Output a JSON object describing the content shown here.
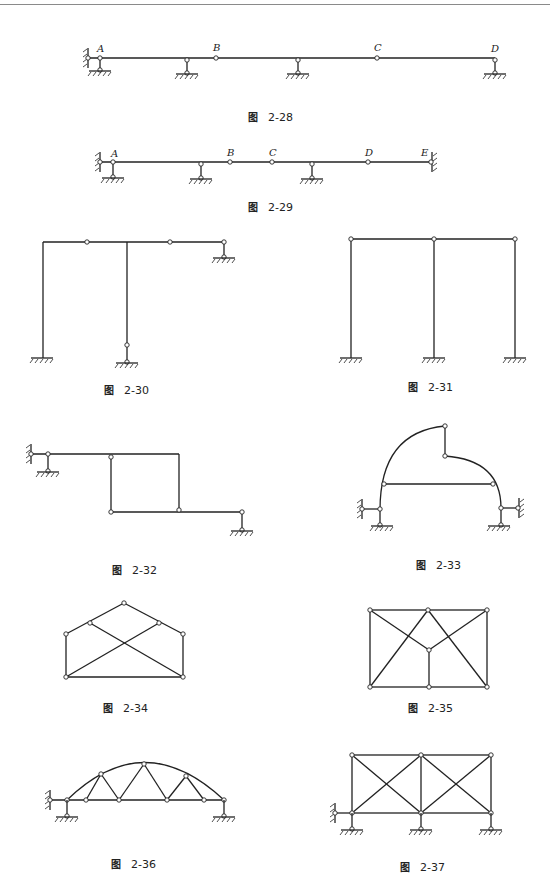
{
  "page": {
    "figure_prefix": "图",
    "figures": [
      {
        "id": "fig-2-28",
        "number": "2-28",
        "type": "multi-span beam",
        "node_labels": [
          "A",
          "B",
          "C",
          "D"
        ]
      },
      {
        "id": "fig-2-29",
        "number": "2-29",
        "type": "multi-span beam, fixed both ends",
        "node_labels": [
          "A",
          "B",
          "C",
          "D",
          "E"
        ]
      },
      {
        "id": "fig-2-30",
        "number": "2-30",
        "type": "frame with hinges"
      },
      {
        "id": "fig-2-31",
        "number": "2-31",
        "type": "two-bay portal frame with hinges"
      },
      {
        "id": "fig-2-32",
        "number": "2-32",
        "type": "stepped frame"
      },
      {
        "id": "fig-2-33",
        "number": "2-33",
        "type": "three-hinged arch with tie"
      },
      {
        "id": "fig-2-34",
        "number": "2-34",
        "type": "gable truss"
      },
      {
        "id": "fig-2-35",
        "number": "2-35",
        "type": "rectangular truss"
      },
      {
        "id": "fig-2-36",
        "number": "2-36",
        "type": "arch truss"
      },
      {
        "id": "fig-2-37",
        "number": "2-37",
        "type": "two-panel braced frame"
      }
    ]
  }
}
